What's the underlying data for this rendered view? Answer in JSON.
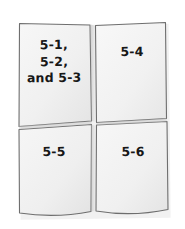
{
  "figure": {
    "background_color": "#ffffff",
    "panel_fill_color": "#f2f2f2",
    "panel_outline_color": "#6e6e6e",
    "label_text_color": "#171717",
    "panel_count": 4
  },
  "panels": [
    {
      "id": "panel-top-left",
      "position": "top-left",
      "label": "5-1,\n5-2,\nand 5-3",
      "label_lines": [
        "5-1,",
        "5-2,",
        "and 5-3"
      ],
      "figures": [
        "5-1",
        "5-2",
        "5-3"
      ]
    },
    {
      "id": "panel-top-right",
      "position": "top-right",
      "label": "5-4",
      "label_lines": [
        "5-4"
      ],
      "figures": [
        "5-4"
      ]
    },
    {
      "id": "panel-bottom-left",
      "position": "bottom-left",
      "label": "5-5",
      "label_lines": [
        "5-5"
      ],
      "figures": [
        "5-5"
      ]
    },
    {
      "id": "panel-bottom-right",
      "position": "bottom-right",
      "label": "5-6",
      "label_lines": [
        "5-6"
      ],
      "figures": [
        "5-6"
      ]
    }
  ]
}
